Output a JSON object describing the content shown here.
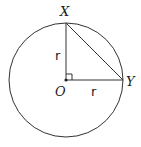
{
  "diagram": {
    "type": "geometry",
    "circle": {
      "cx": 66,
      "cy": 80,
      "r": 57
    },
    "points": {
      "O": {
        "label": "O",
        "x": 66,
        "y": 80
      },
      "X": {
        "label": "X",
        "x": 66,
        "y": 23
      },
      "Y": {
        "label": "Y",
        "x": 123,
        "y": 80
      }
    },
    "segments": [
      {
        "from": "O",
        "to": "X",
        "label": "r"
      },
      {
        "from": "O",
        "to": "Y",
        "label": "r"
      },
      {
        "from": "X",
        "to": "Y",
        "label": ""
      }
    ],
    "right_angle_at": "O",
    "labels": {
      "X": "X",
      "Y": "Y",
      "O": "O",
      "r_vertical": "r",
      "r_horizontal": "r"
    },
    "colors": {
      "stroke": "#333333",
      "background": "#ffffff"
    }
  }
}
